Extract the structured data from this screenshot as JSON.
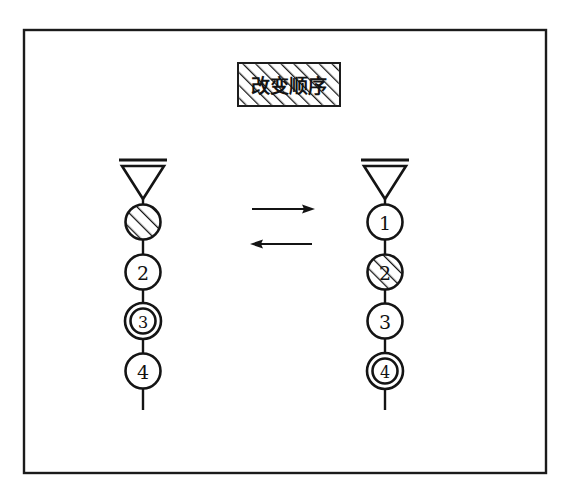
{
  "figure": {
    "title_box": {
      "text": "改变顺序",
      "fill_pattern": "diagonal-hatch",
      "x": 238,
      "y": 63,
      "width": 102,
      "height": 43
    },
    "background_color": "#ffffff",
    "line_color": "#141414",
    "border": {
      "x": 24,
      "y": 30,
      "width": 522,
      "height": 443
    }
  },
  "arrows": [
    {
      "name": "forward-arrow",
      "direction": "right",
      "x1": 252,
      "x2": 315,
      "y": 209
    },
    {
      "name": "reverse-arrow",
      "direction": "left",
      "x1": 250,
      "x2": 312,
      "y": 244
    }
  ],
  "stacks": [
    {
      "name": "left-chain",
      "center_x": 143,
      "top_symbol": "antenna-triangle",
      "nodes": [
        {
          "label": "1",
          "style": "hatched",
          "label_visible": false,
          "cy": 222
        },
        {
          "label": "2",
          "style": "plain",
          "label_visible": true,
          "cy": 272
        },
        {
          "label": "3",
          "style": "double-ring",
          "label_visible": true,
          "cy": 321
        },
        {
          "label": "4",
          "style": "plain",
          "label_visible": true,
          "cy": 371
        }
      ]
    },
    {
      "name": "right-chain",
      "center_x": 385,
      "top_symbol": "antenna-triangle",
      "nodes": [
        {
          "label": "1",
          "style": "plain",
          "label_visible": true,
          "cy": 222
        },
        {
          "label": "2",
          "style": "hatched",
          "label_visible": true,
          "cy": 272
        },
        {
          "label": "3",
          "style": "plain",
          "label_visible": true,
          "cy": 321
        },
        {
          "label": "4",
          "style": "double-ring",
          "label_visible": true,
          "cy": 371
        }
      ]
    }
  ]
}
